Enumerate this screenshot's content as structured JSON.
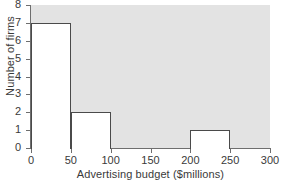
{
  "chart_data": {
    "type": "bar",
    "title": "",
    "xlabel": "Advertising budget ($millions)",
    "ylabel": "Number of firms",
    "bin_width": 50,
    "bin_edges": [
      0,
      50,
      100,
      150,
      200,
      250,
      300
    ],
    "categories": [
      "0-50",
      "50-100",
      "100-150",
      "150-200",
      "200-250",
      "250-300"
    ],
    "values": [
      7,
      2,
      0,
      0,
      1,
      0
    ],
    "xlim": [
      0,
      300
    ],
    "ylim": [
      0,
      8
    ],
    "xticks": [
      0,
      50,
      100,
      150,
      200,
      250,
      300
    ],
    "yticks": [
      0,
      1,
      2,
      3,
      4,
      5,
      6,
      7,
      8
    ],
    "xtick_labels": [
      "0",
      "50",
      "100",
      "150",
      "200",
      "250",
      "300"
    ],
    "ytick_labels": [
      "0",
      "1",
      "2",
      "3",
      "4",
      "5",
      "6",
      "7",
      "8"
    ],
    "grid": false,
    "legend": null,
    "colors": {
      "plot_background": "#e3e3e3",
      "bar_fill": "#ffffff",
      "bar_edge": "#4a4a4a",
      "axis": "#6e6e6e",
      "text": "#3a3a3a"
    }
  }
}
